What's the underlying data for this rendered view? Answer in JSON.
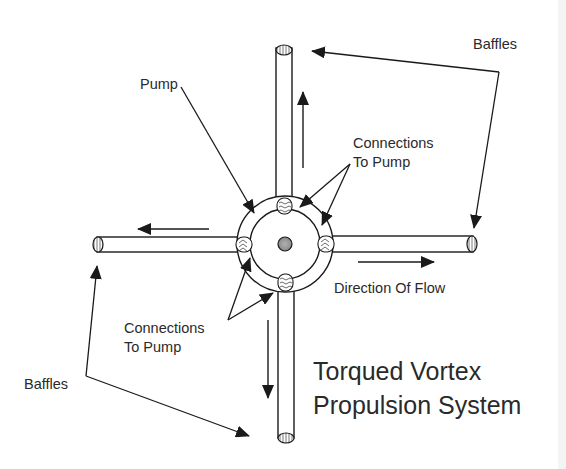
{
  "diagram": {
    "title_line1": "Torqued Vortex",
    "title_line2": "Propulsion System",
    "labels": {
      "pump": "Pump",
      "connections_top_line1": "Connections",
      "connections_top_line2": "To Pump",
      "connections_bottom_line1": "Connections",
      "connections_bottom_line2": "To Pump",
      "baffles_top": "Baffles",
      "baffles_bottom": "Baffles",
      "direction_of_flow": "Direction Of Flow"
    },
    "components": [
      "pump hub",
      "four radial tubes",
      "four connections to pump",
      "four baffles at tube ends"
    ],
    "flow_directions": {
      "top_tube": "up",
      "right_tube": "right",
      "bottom_tube": "down",
      "left_tube": "left"
    },
    "colors": {
      "line": "#1a1a1a",
      "text": "#2a2a2a",
      "background": "#ffffff",
      "pump_fill": "#9a9a9a"
    }
  }
}
